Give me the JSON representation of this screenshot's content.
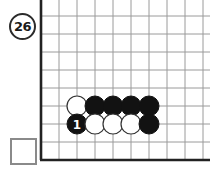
{
  "diagram": {
    "type": "go-board-problem",
    "move_number_badge": "26",
    "capture_box_label": "",
    "board": {
      "columns": 9,
      "rows": 9,
      "edge_left": true,
      "edge_bottom": true,
      "grid_color": "#9a9a9a",
      "edge_color": "#222222",
      "origin_x": 41,
      "origin_y": 16,
      "spacing": 18
    },
    "stones": [
      {
        "id": "stone-w-1",
        "color": "white",
        "col": 2,
        "row": 5,
        "label": "",
        "cx": 77,
        "cy": 106
      },
      {
        "id": "stone-b-1",
        "color": "black",
        "col": 3,
        "row": 5,
        "label": "",
        "cx": 95,
        "cy": 106
      },
      {
        "id": "stone-b-2",
        "color": "black",
        "col": 4,
        "row": 5,
        "label": "",
        "cx": 113,
        "cy": 106
      },
      {
        "id": "stone-b-3",
        "color": "black",
        "col": 5,
        "row": 5,
        "label": "",
        "cx": 131,
        "cy": 106
      },
      {
        "id": "stone-b-4",
        "color": "black",
        "col": 6,
        "row": 5,
        "label": "",
        "cx": 149,
        "cy": 106
      },
      {
        "id": "stone-b-move1",
        "color": "black",
        "col": 2,
        "row": 6,
        "label": "1",
        "cx": 77,
        "cy": 124
      },
      {
        "id": "stone-w-2",
        "color": "white",
        "col": 3,
        "row": 6,
        "label": "",
        "cx": 95,
        "cy": 124
      },
      {
        "id": "stone-w-3",
        "color": "white",
        "col": 4,
        "row": 6,
        "label": "",
        "cx": 113,
        "cy": 124
      },
      {
        "id": "stone-w-4",
        "color": "white",
        "col": 5,
        "row": 6,
        "label": "",
        "cx": 131,
        "cy": 124
      },
      {
        "id": "stone-b-5",
        "color": "black",
        "col": 6,
        "row": 6,
        "label": "",
        "cx": 149,
        "cy": 124
      }
    ],
    "colors": {
      "black_stone": "#121212",
      "white_stone": "#ffffff",
      "stone_outline": "#333333",
      "label_on_black": "#ffffff",
      "grid": "#9a9a9a",
      "edge": "#222222",
      "badge_border": "#2b2b2b",
      "box_border": "#8a8a8a",
      "background": "#ffffff"
    }
  }
}
